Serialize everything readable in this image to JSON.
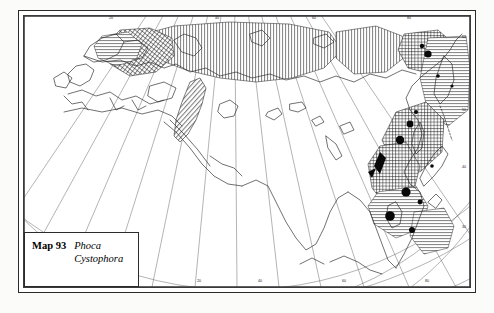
{
  "figure": {
    "kind": "distribution-map",
    "caption": {
      "map_number": "Map 93",
      "taxa": [
        "Phoca",
        "Cystophora"
      ]
    },
    "projection": "conic",
    "region": "Eurasia and the Arctic Ocean"
  },
  "axes": {
    "top_labels": [
      "20",
      "40",
      "60",
      "80",
      "100",
      "120"
    ],
    "bottom_labels": [
      "20",
      "40",
      "60",
      "80",
      "100",
      "120"
    ],
    "right_labels": [
      "60",
      "50",
      "40",
      "30"
    ],
    "left_labels": []
  },
  "legend_patterns": {
    "vertical_hatch": "range-vertical-hatch",
    "horizontal_hatch": "range-horizontal-hatch",
    "cross_hatch": "range-cross-hatch",
    "diagonal_hatch": "range-diagonal-hatch",
    "solid_dot": "point-record"
  },
  "colors": {
    "ink": "#1b1b1b",
    "paper": "#ffffff",
    "page": "#fbfbfa",
    "graticule": "#4a4a4a",
    "coastline": "#262626"
  }
}
